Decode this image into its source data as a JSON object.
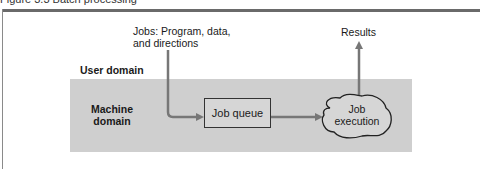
{
  "figure": {
    "title": "Figure 3.3  Batch processing"
  },
  "domains": {
    "user": "User domain",
    "machine_line1": "Machine",
    "machine_line2": "domain"
  },
  "nodes": {
    "jobs_input_line1": "Jobs: Program, data,",
    "jobs_input_line2": "and directions",
    "job_queue": "Job queue",
    "job_execution_line1": "Job",
    "job_execution_line2": "execution",
    "results": "Results"
  },
  "colors": {
    "machine_area": "#cfcfcf",
    "arrow": "#777777",
    "outline": "#333333"
  }
}
